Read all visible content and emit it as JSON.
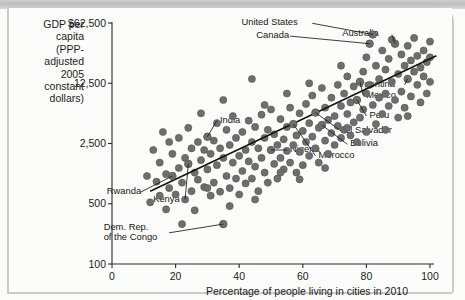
{
  "chart_data": {
    "type": "scatter",
    "title": "",
    "ylabel": "GDP per\ncapita\n(PPP-\nadjusted\n2005\nconstant\ndollars)",
    "xlabel": "Percentage of people living in cities in 2010",
    "yscale": "log",
    "ylim": [
      100,
      62500
    ],
    "xlim": [
      0,
      100
    ],
    "grid": false,
    "legend": null,
    "yticks": [
      {
        "value": 62500,
        "label": "$62,500"
      },
      {
        "value": 12500,
        "label": "12,500"
      },
      {
        "value": 2500,
        "label": "2,500"
      },
      {
        "value": 500,
        "label": "500"
      },
      {
        "value": 100,
        "label": "100"
      }
    ],
    "xticks": [
      {
        "value": 0,
        "label": "0"
      },
      {
        "value": 20,
        "label": "20"
      },
      {
        "value": 40,
        "label": "40"
      },
      {
        "value": 60,
        "label": "60"
      },
      {
        "value": 80,
        "label": "80"
      },
      {
        "value": 100,
        "label": "100"
      }
    ],
    "trendline": {
      "x0": 12,
      "y0": 700,
      "x1": 102,
      "y1": 26000
    },
    "dot_color": "#6e6e6e",
    "line_color": "#121212",
    "annotations": [
      {
        "label": "United States",
        "x": 82,
        "y": 46000,
        "lx": 63,
        "ly": 62000
      },
      {
        "label": "Canada",
        "x": 81,
        "y": 36000,
        "lx": 56,
        "ly": 44000
      },
      {
        "label": "Australia",
        "x": 89,
        "y": 36000,
        "lx": 88,
        "ly": 46000
      },
      {
        "label": "Argentina",
        "x": 93,
        "y": 14000,
        "lx": 92,
        "ly": 12000
      },
      {
        "label": "Mexico",
        "x": 78,
        "y": 13000,
        "lx": 79,
        "ly": 9000
      },
      {
        "label": "Peru",
        "x": 77,
        "y": 8000,
        "lx": 80,
        "ly": 5200
      },
      {
        "label": "El Salvador",
        "x": 64,
        "y": 5700,
        "lx": 72,
        "ly": 3500
      },
      {
        "label": "Bolivia",
        "x": 66,
        "y": 4100,
        "lx": 74,
        "ly": 2450
      },
      {
        "label": "Morocco",
        "x": 57,
        "y": 4200,
        "lx": 64,
        "ly": 1800
      },
      {
        "label": "India",
        "x": 30,
        "y": 3000,
        "lx": 33,
        "ly": 4600
      },
      {
        "label": "Nigeria",
        "x": 50,
        "y": 2100,
        "lx": 55,
        "ly": 2100
      },
      {
        "label": "Rwanda",
        "x": 19,
        "y": 1050,
        "lx": 9,
        "ly": 680
      },
      {
        "label": "Kenya",
        "x": 24,
        "y": 1450,
        "lx": 23,
        "ly": 560
      },
      {
        "label": "Dem. Rep.\nof the Congo",
        "x": 35,
        "y": 290,
        "lx": 18,
        "ly": 230
      }
    ],
    "points": [
      [
        11,
        1050
      ],
      [
        12,
        520
      ],
      [
        13,
        2100
      ],
      [
        14,
        900
      ],
      [
        15,
        1500
      ],
      [
        15,
        620
      ],
      [
        16,
        3400
      ],
      [
        17,
        1100
      ],
      [
        17,
        430
      ],
      [
        18,
        2600
      ],
      [
        18,
        760
      ],
      [
        19,
        1050
      ],
      [
        19,
        1900
      ],
      [
        20,
        640
      ],
      [
        21,
        1300
      ],
      [
        21,
        2900
      ],
      [
        22,
        290
      ],
      [
        22,
        880
      ],
      [
        23,
        1700
      ],
      [
        23,
        560
      ],
      [
        24,
        1450
      ],
      [
        24,
        3800
      ],
      [
        25,
        700
      ],
      [
        25,
        2200
      ],
      [
        26,
        1150
      ],
      [
        26,
        420
      ],
      [
        27,
        2600
      ],
      [
        27,
        950
      ],
      [
        28,
        1600
      ],
      [
        28,
        5600
      ],
      [
        29,
        780
      ],
      [
        29,
        2100
      ],
      [
        30,
        3000
      ],
      [
        30,
        1250
      ],
      [
        31,
        620
      ],
      [
        31,
        1900
      ],
      [
        32,
        2700
      ],
      [
        32,
        880
      ],
      [
        33,
        4300
      ],
      [
        33,
        1400
      ],
      [
        34,
        690
      ],
      [
        34,
        2200
      ],
      [
        35,
        290
      ],
      [
        35,
        1700
      ],
      [
        36,
        3600
      ],
      [
        36,
        1050
      ],
      [
        37,
        2400
      ],
      [
        37,
        760
      ],
      [
        38,
        1500
      ],
      [
        38,
        5200
      ],
      [
        39,
        980
      ],
      [
        39,
        2900
      ],
      [
        40,
        1800
      ],
      [
        40,
        640
      ],
      [
        41,
        3400
      ],
      [
        41,
        1200
      ],
      [
        42,
        2100
      ],
      [
        42,
        860
      ],
      [
        43,
        4600
      ],
      [
        43,
        1550
      ],
      [
        44,
        2600
      ],
      [
        44,
        980
      ],
      [
        45,
        1350
      ],
      [
        45,
        3900
      ],
      [
        46,
        2200
      ],
      [
        46,
        700
      ],
      [
        47,
        5400
      ],
      [
        47,
        1700
      ],
      [
        48,
        2900
      ],
      [
        48,
        1150
      ],
      [
        49,
        3600
      ],
      [
        49,
        880
      ],
      [
        50,
        2100
      ],
      [
        50,
        6200
      ],
      [
        51,
        1450
      ],
      [
        51,
        3200
      ],
      [
        52,
        2400
      ],
      [
        52,
        980
      ],
      [
        53,
        4800
      ],
      [
        53,
        1700
      ],
      [
        54,
        2800
      ],
      [
        54,
        1250
      ],
      [
        55,
        3900
      ],
      [
        55,
        2050
      ],
      [
        56,
        6500
      ],
      [
        56,
        1500
      ],
      [
        57,
        4200
      ],
      [
        57,
        2400
      ],
      [
        58,
        3100
      ],
      [
        58,
        1150
      ],
      [
        59,
        5600
      ],
      [
        59,
        2000
      ],
      [
        60,
        3500
      ],
      [
        60,
        1400
      ],
      [
        61,
        7200
      ],
      [
        61,
        2600
      ],
      [
        62,
        4300
      ],
      [
        62,
        1800
      ],
      [
        63,
        9000
      ],
      [
        63,
        3000
      ],
      [
        64,
        5700
      ],
      [
        64,
        2200
      ],
      [
        65,
        3800
      ],
      [
        65,
        1500
      ],
      [
        66,
        4100
      ],
      [
        66,
        11000
      ],
      [
        67,
        6500
      ],
      [
        67,
        2700
      ],
      [
        68,
        4700
      ],
      [
        68,
        1900
      ],
      [
        69,
        8500
      ],
      [
        69,
        3300
      ],
      [
        70,
        5200
      ],
      [
        70,
        2400
      ],
      [
        71,
        12000
      ],
      [
        71,
        4000
      ],
      [
        72,
        6800
      ],
      [
        72,
        2900
      ],
      [
        73,
        9500
      ],
      [
        73,
        3600
      ],
      [
        74,
        5500
      ],
      [
        74,
        15000
      ],
      [
        75,
        7500
      ],
      [
        75,
        3100
      ],
      [
        76,
        11500
      ],
      [
        76,
        4400
      ],
      [
        77,
        8000
      ],
      [
        77,
        2600
      ],
      [
        78,
        13000
      ],
      [
        78,
        5000
      ],
      [
        79,
        17000
      ],
      [
        79,
        6200
      ],
      [
        80,
        9500
      ],
      [
        80,
        3400
      ],
      [
        81,
        36000
      ],
      [
        81,
        12000
      ],
      [
        82,
        46000
      ],
      [
        82,
        7000
      ],
      [
        83,
        20000
      ],
      [
        83,
        4200
      ],
      [
        84,
        14000
      ],
      [
        84,
        8500
      ],
      [
        85,
        30000
      ],
      [
        85,
        5500
      ],
      [
        86,
        18000
      ],
      [
        86,
        9500
      ],
      [
        87,
        24000
      ],
      [
        87,
        6800
      ],
      [
        88,
        13000
      ],
      [
        88,
        40000
      ],
      [
        89,
        36000
      ],
      [
        89,
        8000
      ],
      [
        90,
        16000
      ],
      [
        90,
        5000
      ],
      [
        91,
        27000
      ],
      [
        91,
        10000
      ],
      [
        92,
        20000
      ],
      [
        92,
        6500
      ],
      [
        93,
        14000
      ],
      [
        93,
        34000
      ],
      [
        94,
        23000
      ],
      [
        94,
        8800
      ],
      [
        95,
        17000
      ],
      [
        95,
        42000
      ],
      [
        96,
        12000
      ],
      [
        96,
        26000
      ],
      [
        97,
        19000
      ],
      [
        97,
        7500
      ],
      [
        98,
        30000
      ],
      [
        98,
        15000
      ],
      [
        99,
        22000
      ],
      [
        99,
        9500
      ],
      [
        100,
        38000
      ],
      [
        100,
        13000
      ],
      [
        100,
        25000
      ],
      [
        67,
        1300
      ],
      [
        59,
        960
      ],
      [
        45,
        560
      ],
      [
        37,
        470
      ],
      [
        30,
        760
      ],
      [
        53,
        1150
      ],
      [
        74,
        3800
      ],
      [
        86,
        3600
      ],
      [
        93,
        5200
      ],
      [
        44,
        14000
      ],
      [
        55,
        9500
      ],
      [
        62,
        12500
      ],
      [
        72,
        20000
      ],
      [
        80,
        25000
      ],
      [
        35,
        8000
      ],
      [
        48,
        7000
      ]
    ]
  }
}
